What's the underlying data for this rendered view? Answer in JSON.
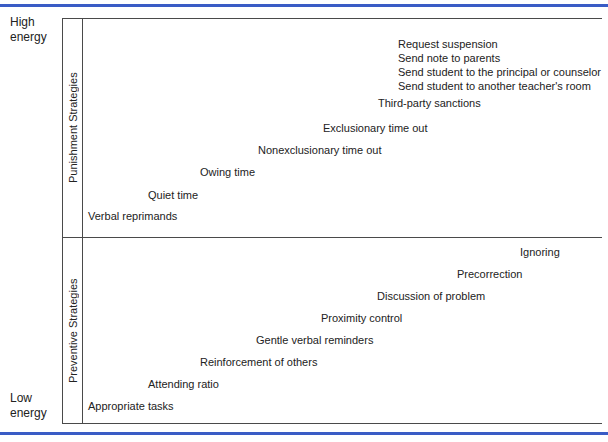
{
  "colors": {
    "rule_blue": "#3a5cc5",
    "border_line": "#4a4a4a",
    "text": "#222222"
  },
  "energy_axis": {
    "high": [
      "High",
      "energy"
    ],
    "low": [
      "Low",
      "energy"
    ]
  },
  "sections": [
    {
      "name": "punishment",
      "label": "Punishment Strategies",
      "items": [
        {
          "label": "Request suspension",
          "x": 398,
          "y": 38
        },
        {
          "label": "Send note to parents",
          "x": 398,
          "y": 52
        },
        {
          "label": "Send student to the principal or counselor",
          "x": 398,
          "y": 66
        },
        {
          "label": "Send student to another teacher's room",
          "x": 398,
          "y": 80
        },
        {
          "label": "Third-party sanctions",
          "x": 378,
          "y": 97
        },
        {
          "label": "Exclusionary time out",
          "x": 323,
          "y": 122
        },
        {
          "label": "Nonexclusionary time out",
          "x": 258,
          "y": 144
        },
        {
          "label": "Owing time",
          "x": 200,
          "y": 166
        },
        {
          "label": "Quiet time",
          "x": 148,
          "y": 189
        },
        {
          "label": "Verbal reprimands",
          "x": 88,
          "y": 210
        }
      ]
    },
    {
      "name": "preventive",
      "label": "Preventive Strategies",
      "items": [
        {
          "label": "Ignoring",
          "x": 520,
          "y": 246
        },
        {
          "label": "Precorrection",
          "x": 457,
          "y": 268
        },
        {
          "label": "Discussion of problem",
          "x": 377,
          "y": 290
        },
        {
          "label": "Proximity control",
          "x": 321,
          "y": 312
        },
        {
          "label": "Gentle verbal reminders",
          "x": 256,
          "y": 334
        },
        {
          "label": "Reinforcement of others",
          "x": 200,
          "y": 356
        },
        {
          "label": "Attending ratio",
          "x": 148,
          "y": 378
        },
        {
          "label": "Appropriate tasks",
          "x": 88,
          "y": 400
        }
      ]
    }
  ]
}
